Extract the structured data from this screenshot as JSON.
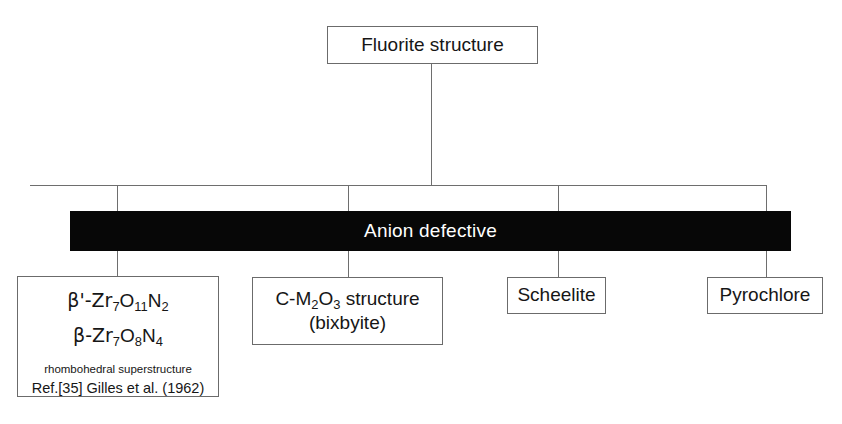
{
  "diagram": {
    "type": "tree-hierarchy",
    "root": {
      "label": "Fluorite structure"
    },
    "banner": {
      "label": "Anion defective",
      "background": "#070707",
      "text_color": "#ffffff"
    },
    "leaves": [
      {
        "id": "zr-oxynitrides",
        "formula_1_prefix": "β'-Zr",
        "formula_1_sub_1": "7",
        "formula_1_mid_1": "O",
        "formula_1_sub_2": "11",
        "formula_1_mid_2": "N",
        "formula_1_sub_3": "2",
        "formula_2_prefix": "β-Zr",
        "formula_2_sub_1": "7",
        "formula_2_mid_1": "O",
        "formula_2_sub_2": "8",
        "formula_2_mid_2": "N",
        "formula_2_sub_3": "4",
        "note": "rhombohedral superstructure",
        "reference": "Ref.[35]  Gilles et al. (1962)"
      },
      {
        "id": "c-m2o3",
        "line_1_prefix": "C-M",
        "line_1_sub": "2",
        "line_1_mid": "O",
        "line_1_sub_2": "3",
        "line_1_suffix": " structure",
        "line_2": "(bixbyite)"
      },
      {
        "id": "scheelite",
        "label": "Scheelite"
      },
      {
        "id": "pyrochlore",
        "label": "Pyrochlore"
      }
    ],
    "colors": {
      "line": "#6e6e6e",
      "box_border": "#6b6b6b",
      "banner_fill": "#070707",
      "page_background": "#ffffff",
      "text": "#161616"
    }
  }
}
